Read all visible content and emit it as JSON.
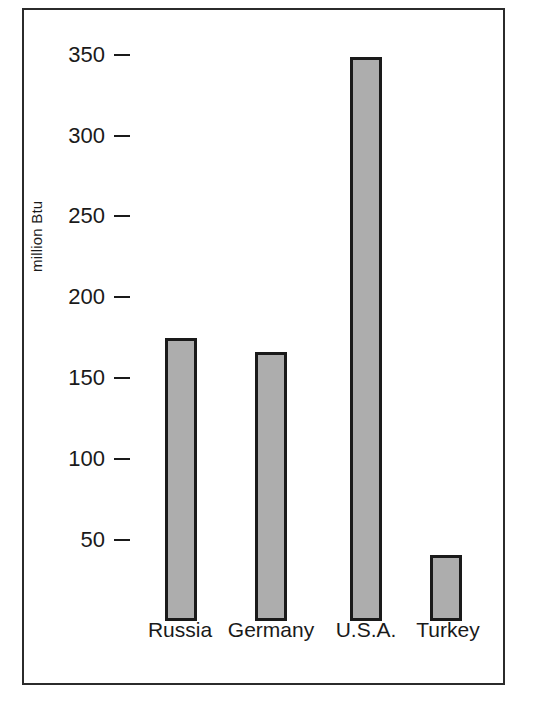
{
  "chart_data": {
    "type": "bar",
    "title": "",
    "xlabel": "",
    "ylabel": "million Btu",
    "categories": [
      "Russia",
      "Germany",
      "U.S.A.",
      "Turkey"
    ],
    "values": [
      175,
      166,
      349,
      41
    ],
    "yticks": [
      350,
      300,
      250,
      200,
      150,
      100,
      50
    ],
    "ytick_labels": [
      "350",
      "300",
      "250",
      "200",
      "150",
      "100",
      "50"
    ],
    "ylim": [
      0,
      365
    ],
    "grid": false,
    "legend": null,
    "bar_fill_color": "#adadad",
    "bar_edge_color": "#1a1a1a",
    "frame_color": "#2b2b2b",
    "background_color": "#ffffff",
    "series": [
      {
        "name": "Energy consumption per capita",
        "values": [
          175,
          166,
          349,
          41
        ]
      }
    ],
    "points": [
      {
        "category": "Russia",
        "value": 175
      },
      {
        "category": "Germany",
        "value": 166
      },
      {
        "category": "U.S.A.",
        "value": 349
      },
      {
        "category": "Turkey",
        "value": 41
      }
    ]
  }
}
